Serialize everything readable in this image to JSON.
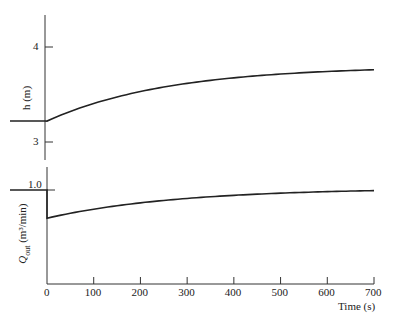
{
  "chart_data": [
    {
      "type": "line",
      "title": "",
      "xlabel": "",
      "ylabel": "h (m)",
      "yticks": [
        "3",
        "4"
      ],
      "ylim": [
        2.8,
        4.3
      ],
      "xlim": [
        -50,
        700
      ],
      "series": [
        {
          "name": "h",
          "x": [
            -50,
            0,
            100,
            200,
            300,
            400,
            500,
            600,
            700
          ],
          "values": [
            3.22,
            3.22,
            3.45,
            3.57,
            3.64,
            3.69,
            3.72,
            3.74,
            3.76
          ]
        }
      ]
    },
    {
      "type": "line",
      "title": "",
      "xlabel": "Time (s)",
      "ylabel": "Q_out (m³/min)",
      "yticks": [
        "1.0"
      ],
      "xticks": [
        "0",
        "100",
        "200",
        "300",
        "400",
        "500",
        "600",
        "700"
      ],
      "xlim": [
        -50,
        700
      ],
      "series": [
        {
          "name": "Q_out",
          "x": [
            -50,
            0,
            0,
            100,
            200,
            300,
            400,
            500,
            600,
            700
          ],
          "values": [
            1.0,
            1.0,
            0.7,
            0.79,
            0.85,
            0.9,
            0.93,
            0.96,
            0.98,
            0.99
          ]
        }
      ]
    }
  ],
  "labels": {
    "h_axis": "h (m)",
    "h_tick_4": "4",
    "h_tick_3": "3",
    "q_axis_main": "Q",
    "q_axis_sub": "out",
    "q_axis_units": "(m³/min)",
    "q_tick_1": "1.0",
    "x_ticks": [
      "0",
      "100",
      "200",
      "300",
      "400",
      "500",
      "600",
      "700"
    ],
    "x_title": "Time (s)"
  }
}
